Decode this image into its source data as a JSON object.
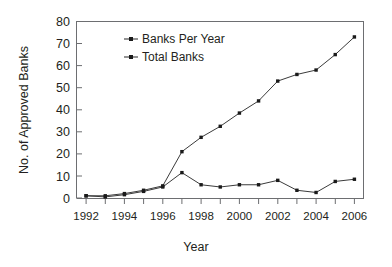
{
  "chart_data": {
    "type": "line",
    "title": "",
    "xlabel": "Year",
    "ylabel": "No. of Approved Banks",
    "x": [
      1992,
      1993,
      1994,
      1995,
      1996,
      1997,
      1998,
      1999,
      2000,
      2001,
      2002,
      2003,
      2004,
      2005,
      2006
    ],
    "xtick_labels": [
      "1992",
      "1994",
      "1996",
      "1998",
      "2000",
      "2002",
      "2004",
      "2006"
    ],
    "xtick_values": [
      1992,
      1994,
      1996,
      1998,
      2000,
      2002,
      2004,
      2006
    ],
    "ytick_labels": [
      "0",
      "10",
      "20",
      "30",
      "40",
      "50",
      "60",
      "70",
      "80"
    ],
    "ytick_values": [
      0,
      10,
      20,
      30,
      40,
      50,
      60,
      70,
      80
    ],
    "xlim": [
      1991.5,
      2006.5
    ],
    "ylim": [
      0,
      80
    ],
    "grid": false,
    "legend_position": "upper-left-inside",
    "marker": "square",
    "series": [
      {
        "name": "Banks Per Year",
        "color": "#3b3b3b",
        "values": [
          1,
          0.5,
          1.5,
          3,
          5,
          11.5,
          6,
          5,
          6,
          6,
          8,
          3.5,
          2.5,
          7.5,
          8.5
        ]
      },
      {
        "name": "Total Banks",
        "color": "#3b3b3b",
        "values": [
          1,
          1,
          2,
          3.5,
          5.5,
          21,
          27.5,
          32.5,
          38.5,
          44,
          53,
          56,
          58,
          65,
          73
        ]
      }
    ]
  },
  "legend": {
    "entries": [
      {
        "label": "Banks Per Year"
      },
      {
        "label": "Total Banks"
      }
    ]
  },
  "axes": {
    "y_title": "No. of Approved Banks",
    "x_title": "Year"
  }
}
